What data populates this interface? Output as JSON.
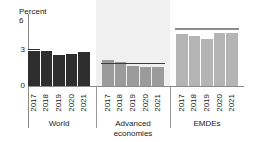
{
  "axis": {
    "unit_label": "Percent",
    "ytick_top": "6",
    "ytick_mid": "3",
    "ytick_zero": "0"
  },
  "legend": {
    "label": "2000-18 average",
    "marker": "line-dash-marker"
  },
  "groups": [
    {
      "name": "World",
      "caption_line1": "World",
      "caption_line2": "",
      "color": "#2e2e2e",
      "years": [
        "2017",
        "2018",
        "2019",
        "2020",
        "2021"
      ],
      "values": [
        3.1,
        3.0,
        2.6,
        2.7,
        2.8
      ],
      "average": 2.9,
      "shaded": false
    },
    {
      "name": "Advanced economies",
      "caption_line1": "Advanced",
      "caption_line2": "economies",
      "color": "#9b9b9b",
      "years": [
        "2017",
        "2018",
        "2019",
        "2020",
        "2021"
      ],
      "values": [
        2.2,
        2.0,
        1.7,
        1.6,
        1.6
      ],
      "average": 1.8,
      "shaded": true
    },
    {
      "name": "EMDEs",
      "caption_line1": "EMDEs",
      "caption_line2": "",
      "color": "#b4b4b4",
      "years": [
        "2017",
        "2018",
        "2019",
        "2020",
        "2021"
      ],
      "values": [
        4.3,
        4.2,
        3.9,
        4.4,
        4.4
      ],
      "average": 4.7,
      "shaded": false
    }
  ],
  "chart_data": {
    "type": "bar",
    "title": "",
    "subtitle": "",
    "xlabel": "",
    "ylabel": "Percent",
    "ylim": [
      0,
      6
    ],
    "yticks": [
      0,
      3,
      6
    ],
    "grid": false,
    "legend_position": "top-center",
    "legend_entries": [
      "2000-18 average"
    ],
    "categories": [
      "2017",
      "2018",
      "2019",
      "2020",
      "2021"
    ],
    "groups": [
      "World",
      "Advanced economies",
      "EMDEs"
    ],
    "series": [
      {
        "name": "World",
        "values": [
          3.1,
          3.0,
          2.6,
          2.7,
          2.8
        ],
        "color": "#2e2e2e"
      },
      {
        "name": "Advanced economies",
        "values": [
          2.2,
          2.0,
          1.7,
          1.6,
          1.6
        ],
        "color": "#9b9b9b"
      },
      {
        "name": "EMDEs",
        "values": [
          4.3,
          4.2,
          3.9,
          4.4,
          4.4
        ],
        "color": "#b4b4b4"
      }
    ],
    "reference_lines": [
      {
        "name": "World 2000-18 average",
        "value": 2.9
      },
      {
        "name": "Advanced economies 2000-18 average",
        "value": 1.8
      },
      {
        "name": "EMDEs 2000-18 average",
        "value": 4.7
      }
    ],
    "annotations": []
  }
}
